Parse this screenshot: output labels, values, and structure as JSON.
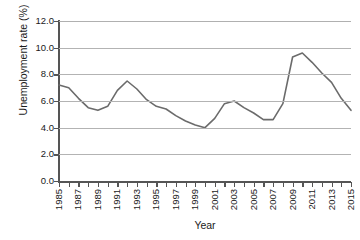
{
  "chart_data": {
    "type": "line",
    "title": "",
    "xlabel": "Year",
    "ylabel": "Unemployment rate (%)",
    "xlim": [
      1985,
      2015
    ],
    "ylim": [
      0.0,
      12.0
    ],
    "y_ticks": [
      "0.0",
      "2.0",
      "4.0",
      "6.0",
      "8.0",
      "10.0",
      "12.0"
    ],
    "y_tick_values": [
      0.0,
      2.0,
      4.0,
      6.0,
      8.0,
      10.0,
      12.0
    ],
    "x_tick_labels": [
      "1985",
      "1987",
      "1989",
      "1991",
      "1993",
      "1995",
      "1997",
      "1999",
      "2001",
      "2003",
      "2005",
      "2007",
      "2009",
      "2011",
      "2013",
      "2015"
    ],
    "x_tick_interval": 2,
    "x_minor_tick_interval": 1,
    "grid": true,
    "grid_axis": "y",
    "legend": "none",
    "line_color": "#6b6b6b",
    "line_width": 1.6,
    "markers": "none",
    "x": [
      1985,
      1986,
      1987,
      1988,
      1989,
      1990,
      1991,
      1992,
      1993,
      1994,
      1995,
      1996,
      1997,
      1998,
      1999,
      2000,
      2001,
      2002,
      2003,
      2004,
      2005,
      2006,
      2007,
      2008,
      2009,
      2010,
      2011,
      2012,
      2013,
      2014,
      2015
    ],
    "values": [
      7.2,
      7.0,
      6.2,
      5.5,
      5.3,
      5.6,
      6.8,
      7.5,
      6.9,
      6.1,
      5.6,
      5.4,
      4.9,
      4.5,
      4.2,
      4.0,
      4.7,
      5.8,
      6.0,
      5.5,
      5.1,
      4.6,
      4.6,
      5.8,
      9.3,
      9.6,
      8.9,
      8.1,
      7.4,
      6.2,
      5.3
    ],
    "series": [
      {
        "name": "Unemployment rate",
        "values": [
          7.2,
          7.0,
          6.2,
          5.5,
          5.3,
          5.6,
          6.8,
          7.5,
          6.9,
          6.1,
          5.6,
          5.4,
          4.9,
          4.5,
          4.2,
          4.0,
          4.7,
          5.8,
          6.0,
          5.5,
          5.1,
          4.6,
          4.6,
          5.8,
          9.3,
          9.6,
          8.9,
          8.1,
          7.4,
          6.2,
          5.3
        ]
      }
    ]
  }
}
